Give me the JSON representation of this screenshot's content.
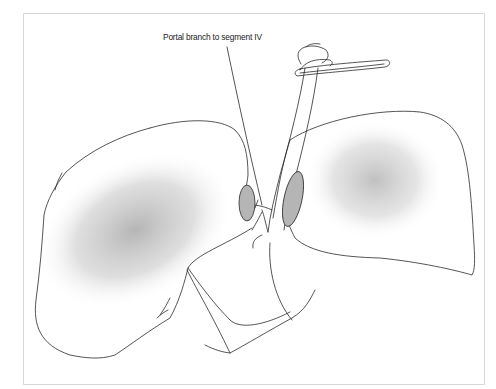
{
  "figure": {
    "type": "medical-illustration",
    "annotations": [
      {
        "text": "Portal branch to segment IV",
        "points_to": "portal-branch-segment-iv"
      }
    ]
  },
  "colors": {
    "line": "#2a2a2a",
    "shading": "#9a9a9a",
    "highlight_fill": "#b5b5b5",
    "frame": "#d8d8d8"
  }
}
